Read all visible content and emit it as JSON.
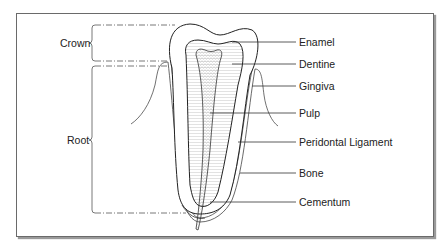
{
  "brackets": {
    "crown": "Crown",
    "root": "Root"
  },
  "labels": {
    "enamel": "Enamel",
    "dentine": "Dentine",
    "gingiva": "Gingiva",
    "pulp": "Pulp",
    "periodontal_ligament": "Peridontal Ligament",
    "bone": "Bone",
    "cementum": "Cementum"
  }
}
